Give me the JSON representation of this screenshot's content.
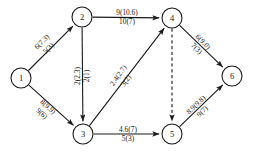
{
  "diagram": {
    "type": "directed-network-flow-graph",
    "node_radius": 10,
    "nodes": [
      {
        "id": "1",
        "label": "1",
        "x": 21,
        "y": 78
      },
      {
        "id": "2",
        "label": "2",
        "x": 82,
        "y": 17
      },
      {
        "id": "3",
        "label": "3",
        "x": 83,
        "y": 134
      },
      {
        "id": "4",
        "label": "4",
        "x": 172,
        "y": 18
      },
      {
        "id": "5",
        "label": "5",
        "x": 172,
        "y": 134
      },
      {
        "id": "6",
        "label": "6",
        "x": 232,
        "y": 76
      }
    ],
    "edges": [
      {
        "id": "e-1-2",
        "from": "1",
        "to": "2",
        "style": "solid",
        "arrow": true,
        "upper_label": "6(7.3)",
        "lower_label": "5(3)",
        "label_x": 45,
        "label_y": 45,
        "rotate": -45
      },
      {
        "id": "e-1-3",
        "from": "1",
        "to": "3",
        "style": "solid",
        "arrow": true,
        "upper_label": "8(9.9)",
        "lower_label": "9(6)",
        "label_x": 45,
        "label_y": 110,
        "rotate": 42
      },
      {
        "id": "e-2-4",
        "from": "2",
        "to": "4",
        "style": "solid",
        "arrow": true,
        "upper_label": "9(10.6)",
        "lower_label": "10(7)",
        "label_x": 127,
        "label_y": 17,
        "rotate": 0
      },
      {
        "id": "e-2-3",
        "from": "2",
        "to": "3",
        "style": "solid",
        "arrow": true,
        "upper_label": "2(2.3)",
        "lower_label": "2(1)",
        "label_x": 82,
        "label_y": 76,
        "rotate": -90
      },
      {
        "id": "e-3-4",
        "from": "3",
        "to": "4",
        "style": "solid",
        "arrow": true,
        "upper_label": "2.4(2.7)",
        "lower_label": "3(2)",
        "label_x": 122,
        "label_y": 78,
        "rotate": -55
      },
      {
        "id": "e-3-5",
        "from": "3",
        "to": "5",
        "style": "solid",
        "arrow": true,
        "upper_label": "4.6(7)",
        "lower_label": "5(3)",
        "label_x": 128,
        "label_y": 134,
        "rotate": 0
      },
      {
        "id": "e-4-6",
        "from": "4",
        "to": "6",
        "style": "solid",
        "arrow": true,
        "upper_label": "6(9.0)",
        "lower_label": "7(3)",
        "label_x": 200,
        "label_y": 45,
        "rotate": 44
      },
      {
        "id": "e-5-6",
        "from": "5",
        "to": "6",
        "style": "solid",
        "arrow": true,
        "upper_label": "8.9(9.8)",
        "lower_label": "9(7)",
        "label_x": 199,
        "label_y": 108,
        "rotate": -44
      },
      {
        "id": "e-4-5",
        "from": "4",
        "to": "5",
        "style": "dashed",
        "arrow": true,
        "upper_label": "",
        "lower_label": "",
        "label_x": 172,
        "label_y": 76,
        "rotate": -90
      }
    ],
    "colors": {
      "stroke": "#1a1a1a",
      "node_fill": "#ffffff",
      "background": "#ffffff"
    }
  }
}
